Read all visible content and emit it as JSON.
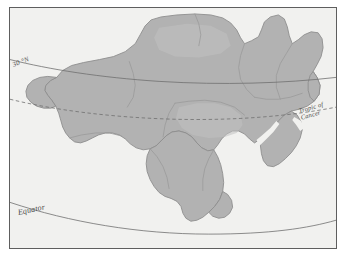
{
  "figure": {
    "kind": "reference-map",
    "width": 346,
    "height": 258
  },
  "colors": {
    "background": "#ffffff",
    "ocean": "#f1f1ef",
    "land": "#b2b2b2",
    "land_light": "#c4c4c4",
    "coastline": "#8e8e8e",
    "internal_border": "#9a9a9a",
    "frame": "#5e5e5e",
    "graticule": "#6f6f6f",
    "label_text": "#4a4a4a"
  },
  "graticule": {
    "lines": [
      {
        "id": "lat-30n",
        "label": "30 °N",
        "style": "solid",
        "label_rotation_deg": -21
      },
      {
        "id": "tropic-of-cancer",
        "label_line_1": "Tropic of",
        "label_line_2": "Cancer",
        "style": "dashed",
        "label_rotation_deg": -16
      },
      {
        "id": "equator",
        "label": "Equator",
        "style": "solid",
        "label_rotation_deg": -12
      }
    ]
  },
  "labels": {
    "lat_30n": "30 °N",
    "tropic_of_cancer_line1": "Tropic of",
    "tropic_of_cancer_line2": "Cancer",
    "equator": "Equator"
  }
}
